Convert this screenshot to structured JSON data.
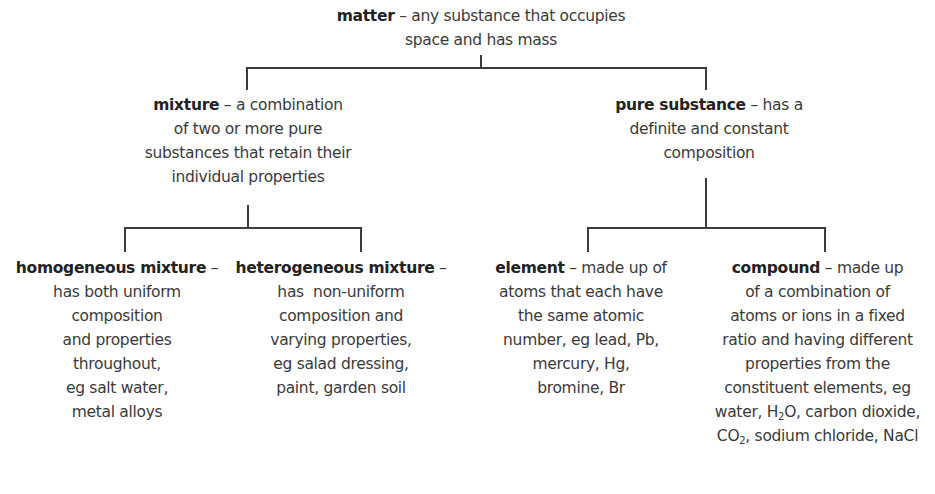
{
  "diagram": {
    "colors": {
      "text": "#3a3a3a",
      "term": "#222222",
      "lines": "#3c3c3c",
      "background": "#ffffff"
    },
    "nodes": {
      "matter": {
        "term": "matter",
        "dash": " – ",
        "lines": [
          "any substance that occupies",
          "space and has mass"
        ]
      },
      "mixture": {
        "term": "mixture",
        "dash": " – ",
        "lines": [
          "a combination",
          "of two or more pure",
          "substances that retain their",
          "individual properties"
        ]
      },
      "pure_substance": {
        "term": "pure substance",
        "dash": " – ",
        "lines": [
          "has a",
          "definite and constant",
          "composition"
        ]
      },
      "homogeneous_mixture": {
        "term": "homogeneous mixture",
        "dash": " –",
        "lines": [
          "has both uniform",
          "composition",
          "and properties",
          "throughout,",
          "eg salt water,",
          "metal alloys"
        ]
      },
      "heterogeneous_mixture": {
        "term": "heterogeneous mixture",
        "dash": " –",
        "lines": [
          "has  non-uniform",
          "composition and",
          "varying properties,",
          "eg salad dressing,",
          "paint, garden soil"
        ]
      },
      "element": {
        "term": "element",
        "dash": " – ",
        "lines": [
          "made up of",
          "atoms that each have",
          "the same atomic",
          "number, eg lead, Pb,",
          "mercury, Hg,",
          "bromine, Br"
        ]
      },
      "compound": {
        "term": "compound",
        "dash": " – ",
        "lines": [
          "made up",
          "of a combination of",
          "atoms or ions in a fixed",
          "ratio and having different",
          "properties from the",
          "constituent elements, eg"
        ],
        "line7": {
          "pre": "water, H",
          "sub": "2",
          "post": "O, carbon dioxide,"
        },
        "line8": {
          "pre": "CO",
          "sub": "2",
          "post": ", sodium chloride, NaCl"
        }
      }
    },
    "edges": [
      {
        "from": "matter",
        "to": "mixture"
      },
      {
        "from": "matter",
        "to": "pure_substance"
      },
      {
        "from": "mixture",
        "to": "homogeneous_mixture"
      },
      {
        "from": "mixture",
        "to": "heterogeneous_mixture"
      },
      {
        "from": "pure_substance",
        "to": "element"
      },
      {
        "from": "pure_substance",
        "to": "compound"
      }
    ]
  }
}
